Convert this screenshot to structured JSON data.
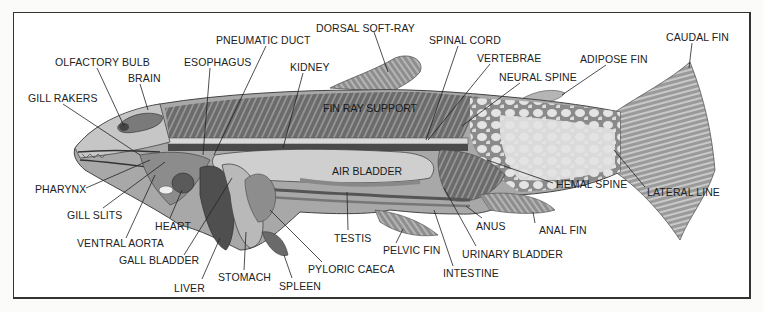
{
  "diagram": {
    "colors": {
      "frame": "#333333",
      "ink": "#222222",
      "body_dark": "#6e6e6e",
      "body_mid": "#9a9a9a",
      "body_light": "#d8d8d8",
      "tail_light": "#e6e6e6"
    },
    "labels": [
      {
        "id": "dorsal-soft-ray",
        "text": "DORSAL SOFT-RAY",
        "x": 316,
        "y": 22,
        "lx1": 374,
        "ly1": 32,
        "lx2": 388,
        "ly2": 72
      },
      {
        "id": "spinal-cord",
        "text": "SPINAL CORD",
        "x": 429,
        "y": 34,
        "lx1": 458,
        "ly1": 46,
        "lx2": 426,
        "ly2": 140
      },
      {
        "id": "caudal-fin",
        "text": "CAUDAL FIN",
        "x": 666,
        "y": 31,
        "lx1": 692,
        "ly1": 43,
        "lx2": 689,
        "ly2": 68
      },
      {
        "id": "pneumatic-duct",
        "text": "PNEUMATIC DUCT",
        "x": 216,
        "y": 34,
        "lx1": 266,
        "ly1": 46,
        "lx2": 214,
        "ly2": 155
      },
      {
        "id": "vertebrae",
        "text": "VERTEBRAE",
        "x": 477,
        "y": 52,
        "lx1": 490,
        "ly1": 64,
        "lx2": 428,
        "ly2": 140
      },
      {
        "id": "adipose-fin",
        "text": "ADIPOSE FIN",
        "x": 580,
        "y": 53,
        "lx1": 606,
        "ly1": 65,
        "lx2": 562,
        "ly2": 95
      },
      {
        "id": "olfactory-bulb",
        "text": "OLFACTORY BULB",
        "x": 55,
        "y": 56,
        "lx1": 97,
        "ly1": 68,
        "lx2": 124,
        "ly2": 126
      },
      {
        "id": "esophagus",
        "text": "ESOPHAGUS",
        "x": 184,
        "y": 56,
        "lx1": 210,
        "ly1": 68,
        "lx2": 203,
        "ly2": 155
      },
      {
        "id": "kidney",
        "text": "KIDNEY",
        "x": 290,
        "y": 61,
        "lx1": 303,
        "ly1": 73,
        "lx2": 283,
        "ly2": 148
      },
      {
        "id": "brain",
        "text": "BRAIN",
        "x": 128,
        "y": 72,
        "lx1": 140,
        "ly1": 84,
        "lx2": 148,
        "ly2": 110
      },
      {
        "id": "neural-spine",
        "text": "NEURAL SPINE",
        "x": 499,
        "y": 71,
        "lx1": 520,
        "ly1": 83,
        "lx2": 462,
        "ly2": 126
      },
      {
        "id": "gill-rakers",
        "text": "GILL RAKERS",
        "x": 28,
        "y": 92,
        "lx1": 63,
        "ly1": 104,
        "lx2": 140,
        "ly2": 155
      },
      {
        "id": "pharynx",
        "text": "PHARYNX",
        "x": 35,
        "y": 183,
        "lx1": 86,
        "ly1": 188,
        "lx2": 150,
        "ly2": 160
      },
      {
        "id": "hemal-spine",
        "text": "HEMAL SPINE",
        "x": 556,
        "y": 178,
        "lx1": 553,
        "ly1": 183,
        "lx2": 487,
        "ly2": 160
      },
      {
        "id": "lateral-line",
        "text": "LATERAL LINE",
        "x": 647,
        "y": 186,
        "lx1": 645,
        "ly1": 187,
        "lx2": 614,
        "ly2": 150
      },
      {
        "id": "gill-slits",
        "text": "GILL SLITS",
        "x": 67,
        "y": 209,
        "lx1": 103,
        "ly1": 208,
        "lx2": 165,
        "ly2": 162
      },
      {
        "id": "heart",
        "text": "HEART",
        "x": 155,
        "y": 220,
        "lx1": 170,
        "ly1": 218,
        "lx2": 182,
        "ly2": 190
      },
      {
        "id": "anus",
        "text": "ANUS",
        "x": 476,
        "y": 220,
        "lx1": 482,
        "ly1": 218,
        "lx2": 466,
        "ly2": 206
      },
      {
        "id": "anal-fin",
        "text": "ANAL FIN",
        "x": 539,
        "y": 224,
        "lx1": 535,
        "ly1": 223,
        "lx2": 533,
        "ly2": 212
      },
      {
        "id": "testis",
        "text": "TESTIS",
        "x": 334,
        "y": 232,
        "lx1": 348,
        "ly1": 230,
        "lx2": 347,
        "ly2": 192
      },
      {
        "id": "ventral-aorta",
        "text": "VENTRAL AORTA",
        "x": 77,
        "y": 237,
        "lx1": 126,
        "ly1": 238,
        "lx2": 155,
        "ly2": 175
      },
      {
        "id": "pelvic-fin",
        "text": "PELVIC FIN",
        "x": 383,
        "y": 244,
        "lx1": 396,
        "ly1": 243,
        "lx2": 403,
        "ly2": 229
      },
      {
        "id": "urinary-bladder",
        "text": "URINARY BLADDER",
        "x": 462,
        "y": 248,
        "lx1": 476,
        "ly1": 246,
        "lx2": 444,
        "ly2": 188
      },
      {
        "id": "gall-bladder",
        "text": "GALL BLADDER",
        "x": 119,
        "y": 254,
        "lx1": 184,
        "ly1": 255,
        "lx2": 232,
        "ly2": 178
      },
      {
        "id": "pyloric-caeca",
        "text": "PYLORIC CAECA",
        "x": 308,
        "y": 263,
        "lx1": 322,
        "ly1": 262,
        "lx2": 270,
        "ly2": 210
      },
      {
        "id": "stomach",
        "text": "STOMACH",
        "x": 218,
        "y": 271,
        "lx1": 244,
        "ly1": 270,
        "lx2": 246,
        "ly2": 232
      },
      {
        "id": "intestine",
        "text": "INTESTINE",
        "x": 443,
        "y": 267,
        "lx1": 453,
        "ly1": 266,
        "lx2": 434,
        "ly2": 210
      },
      {
        "id": "liver",
        "text": "LIVER",
        "x": 174,
        "y": 282,
        "lx1": 202,
        "ly1": 279,
        "lx2": 220,
        "ly2": 238
      },
      {
        "id": "spleen",
        "text": "SPLEEN",
        "x": 279,
        "y": 280,
        "lx1": 292,
        "ly1": 278,
        "lx2": 284,
        "ly2": 255
      }
    ],
    "inner_labels": [
      {
        "id": "fin-ray-support",
        "text": "FIN RAY SUPPORT",
        "x": 323,
        "y": 102
      },
      {
        "id": "air-bladder",
        "text": "AIR BLADDER",
        "x": 332,
        "y": 165
      }
    ]
  }
}
